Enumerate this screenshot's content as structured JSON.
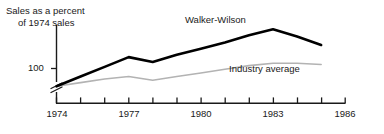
{
  "chart_data": {
    "type": "line",
    "title": "Sales as a percent of 1974 sales",
    "title_lines": [
      "Sales as a percent",
      "of 1974 sales"
    ],
    "xlabel": "",
    "ylabel": "Sales as a percent of 1974 sales",
    "x": [
      1974,
      1975,
      1976,
      1977,
      1978,
      1979,
      1980,
      1981,
      1982,
      1983,
      1984,
      1985
    ],
    "xlim": [
      1974,
      1986
    ],
    "x_ticks": [
      1974,
      1975,
      1976,
      1977,
      1978,
      1979,
      1980,
      1981,
      1982,
      1983,
      1984,
      1985,
      1986
    ],
    "x_tick_labels": [
      "1974",
      "",
      "",
      "1977",
      "",
      "",
      "1980",
      "",
      "",
      "1983",
      "",
      "",
      "1986"
    ],
    "y_ticks": [
      100
    ],
    "y_tick_labels": [
      "100"
    ],
    "ylim": [
      92,
      148
    ],
    "axis_break": true,
    "grid": false,
    "legend": "inline-annotations",
    "series": [
      {
        "name": "Walker-Wilson",
        "color": "#000000",
        "width": 2.6,
        "label_position": "above-line",
        "values": [
          100,
          108,
          116,
          124,
          120,
          126,
          131,
          136,
          142,
          147,
          141,
          134
        ]
      },
      {
        "name": "Industry average",
        "color": "#b3b3b3",
        "width": 1.6,
        "label_position": "below-line",
        "values": [
          100,
          103,
          106,
          108,
          105,
          108,
          111,
          114,
          117,
          119,
          119,
          118
        ]
      }
    ],
    "annotations": [
      {
        "text": "Walker-Wilson",
        "series": "Walker-Wilson"
      },
      {
        "text": "Industry average",
        "series": "Industry average"
      }
    ]
  },
  "figure": {
    "title_line1": "Sales as a percent",
    "title_line2": "of 1974 sales",
    "y_tick_100": "100",
    "series_label_walker": "Walker-Wilson",
    "series_label_industry": "Industry average",
    "x_labels": {
      "t1974": "1974",
      "t1977": "1977",
      "t1980": "1980",
      "t1983": "1983",
      "t1986": "1986"
    },
    "colors": {
      "walker_wilson": "#000000",
      "industry_average": "#b3b3b3",
      "axis": "#1a1a1a",
      "text": "#1a1a1a",
      "background": "#ffffff"
    }
  }
}
